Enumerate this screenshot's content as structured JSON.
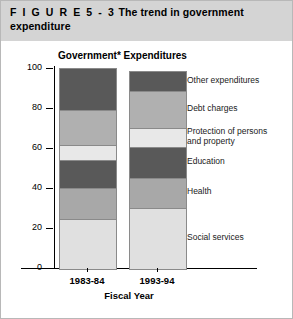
{
  "figure": {
    "label": "F I G U R E   5 - 3",
    "title": "The trend in government expenditure"
  },
  "chart_data": {
    "type": "bar",
    "subtype": "stacked-bar-100",
    "title": "Government* Expenditures",
    "xlabel": "Fiscal Year",
    "ylabel": "",
    "ylim": [
      0,
      100
    ],
    "yticks": [
      0,
      20,
      40,
      60,
      80,
      100
    ],
    "ytick_labels": [
      "0",
      "20",
      "40",
      "60",
      "80",
      "100"
    ],
    "grid": false,
    "legend_position": "right",
    "categories": [
      "1983-84",
      "1993-94"
    ],
    "series": [
      {
        "name": "Social services",
        "values": [
          25.0,
          30.5
        ],
        "color": "#e0e0e0"
      },
      {
        "name": "Health",
        "values": [
          15.5,
          15.0
        ],
        "color": "#a8a8a8"
      },
      {
        "name": "Education",
        "values": [
          14.0,
          15.5
        ],
        "color": "#595959"
      },
      {
        "name": "Protection of persons and property",
        "values": [
          7.5,
          9.5
        ],
        "color": "#e8e8e8"
      },
      {
        "name": "Debt charges",
        "values": [
          17.5,
          18.5
        ],
        "color": "#b0b0b0"
      },
      {
        "name": "Other expenditures",
        "values": [
          20.5,
          9.5
        ],
        "color": "#595959"
      }
    ],
    "legend_entries": [
      "Other expenditures",
      "Debt charges",
      "Protection of persons\nand property",
      "Education",
      "Health",
      "Social services"
    ]
  }
}
